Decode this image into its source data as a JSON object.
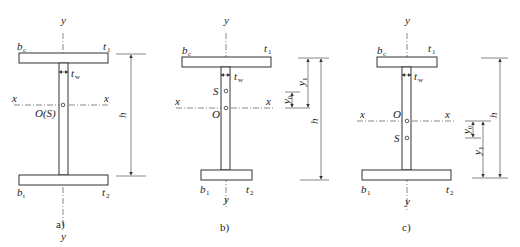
{
  "figure": {
    "panels": [
      {
        "caption": "a)",
        "labels": {
          "y_top": "y",
          "y_bottom": "y",
          "x_left": "x",
          "x_right": "x",
          "top_flange_width": "b",
          "top_flange_width_sub": "c",
          "top_flange_thickness": "t",
          "top_flange_thickness_sub": "1",
          "web_thickness": "t",
          "web_thickness_sub": "w",
          "bottom_flange_width": "b",
          "bottom_flange_width_sub": "t",
          "bottom_flange_thickness": "t",
          "bottom_flange_thickness_sub": "2",
          "centroid": "O(S)",
          "height": "h"
        }
      },
      {
        "caption": "b)",
        "labels": {
          "y_top": "y",
          "y_bottom": "y",
          "x_left": "x",
          "x_right": "x",
          "top_flange_width": "b",
          "top_flange_width_sub": "c",
          "top_flange_thickness": "t",
          "top_flange_thickness_sub": "1",
          "web_thickness": "t",
          "web_thickness_sub": "w",
          "bottom_flange_width": "b",
          "bottom_flange_width_sub": "1",
          "bottom_flange_thickness": "t",
          "bottom_flange_thickness_sub": "2",
          "shear_center": "S",
          "centroid": "O",
          "y0": "y",
          "y0_sub": "0",
          "y1": "y",
          "y1_sub": "1",
          "height": "h"
        }
      },
      {
        "caption": "c)",
        "labels": {
          "y_top": "y",
          "y_bottom": "y",
          "x_left": "x",
          "x_right": "x",
          "top_flange_width": "b",
          "top_flange_width_sub": "c",
          "top_flange_thickness": "t",
          "top_flange_thickness_sub": "1",
          "web_thickness": "t",
          "web_thickness_sub": "w",
          "bottom_flange_width": "b",
          "bottom_flange_width_sub": "1",
          "bottom_flange_thickness": "t",
          "bottom_flange_thickness_sub": "2",
          "shear_center": "S",
          "centroid": "O",
          "y0": "y",
          "y0_sub": "0",
          "y1": "y",
          "y1_sub": "1",
          "height": "h"
        }
      }
    ]
  }
}
